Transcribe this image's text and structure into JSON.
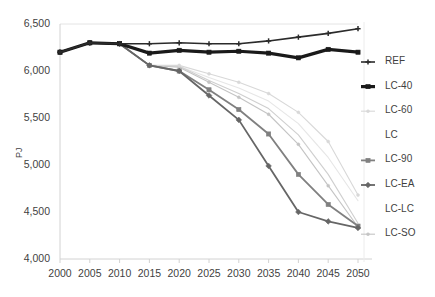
{
  "chart_data": {
    "type": "line",
    "title": "",
    "xlabel": "",
    "ylabel": "PJ",
    "x": [
      2000,
      2005,
      2010,
      2015,
      2020,
      2025,
      2030,
      2035,
      2040,
      2045,
      2050
    ],
    "xlim": [
      2000,
      2050
    ],
    "ylim": [
      4000,
      6500
    ],
    "ytick_labels": [
      "6,500",
      "6,000",
      "5,500",
      "5,000",
      "4,500",
      "4,000"
    ],
    "ytick_values": [
      6500,
      6000,
      5500,
      5000,
      4500,
      4000
    ],
    "xtick_labels": [
      "2000",
      "2005",
      "2010",
      "2015",
      "2020",
      "2025",
      "2030",
      "2035",
      "2040",
      "2045",
      "2050"
    ],
    "grid": "horizontal-top-only",
    "legend_position": "right",
    "series": [
      {
        "name": "REF",
        "color": "#2b2b2b",
        "marker": "plus",
        "width": 1.6,
        "values": [
          6200,
          6300,
          6290,
          6290,
          6300,
          6290,
          6290,
          6320,
          6360,
          6400,
          6450
        ]
      },
      {
        "name": "LC-40",
        "color": "#1a1a1a",
        "marker": "square",
        "width": 3.2,
        "values": [
          6200,
          6300,
          6290,
          6190,
          6220,
          6200,
          6210,
          6190,
          6140,
          6230,
          6200
        ]
      },
      {
        "name": "LC-60",
        "color": "#d8d8d8",
        "marker": "dot",
        "width": 1.1,
        "values": [
          6200,
          6300,
          6290,
          6060,
          6060,
          5970,
          5880,
          5760,
          5560,
          5250,
          4680
        ]
      },
      {
        "name": "LC",
        "color": "#e6e6e6",
        "marker": "none",
        "width": 1.1,
        "values": [
          6200,
          6300,
          6290,
          6060,
          6050,
          5930,
          5820,
          5680,
          5440,
          5080,
          4620
        ]
      },
      {
        "name": "LC-90",
        "color": "#808080",
        "marker": "square",
        "width": 1.8,
        "values": [
          6200,
          6300,
          6290,
          6060,
          6000,
          5800,
          5590,
          5330,
          4900,
          4580,
          4350
        ]
      },
      {
        "name": "LC-EA",
        "color": "#666666",
        "marker": "diamond",
        "width": 1.8,
        "values": [
          6200,
          6300,
          6290,
          6060,
          6000,
          5740,
          5480,
          4990,
          4500,
          4400,
          4330
        ]
      },
      {
        "name": "LC-LC",
        "color": "#cfcfcf",
        "marker": "none",
        "width": 1.1,
        "values": [
          6200,
          6300,
          6290,
          6060,
          6050,
          5900,
          5760,
          5600,
          5320,
          4900,
          4380
        ]
      },
      {
        "name": "LC-SO",
        "color": "#c4c4c4",
        "marker": "dot",
        "width": 1.1,
        "values": [
          6200,
          6300,
          6290,
          6060,
          6040,
          5880,
          5720,
          5540,
          5220,
          4780,
          4340
        ]
      }
    ]
  },
  "legend": {
    "items": [
      {
        "label": "REF"
      },
      {
        "label": "LC-40"
      },
      {
        "label": "LC-60"
      },
      {
        "label": "LC"
      },
      {
        "label": "LC-90"
      },
      {
        "label": "LC-EA"
      },
      {
        "label": "LC-LC"
      },
      {
        "label": "LC-SO"
      }
    ]
  }
}
